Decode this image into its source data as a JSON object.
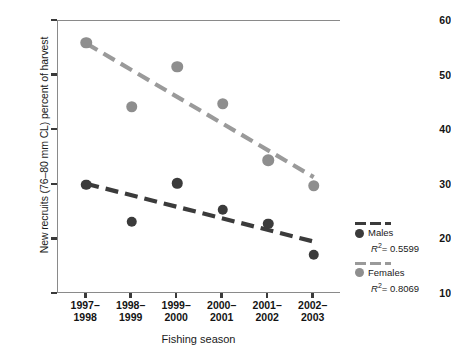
{
  "chart_data": {
    "type": "scatter",
    "title": "",
    "xlabel": "Fishing season",
    "ylabel": "New recruits (76–80 mm CL) percent of harvest",
    "categories": [
      "1997–1998",
      "1998–1999",
      "1999–2000",
      "2000–2001",
      "2001–2002",
      "2002–2003"
    ],
    "categories_lines": [
      [
        "1997–",
        "1998"
      ],
      [
        "1998–",
        "1999"
      ],
      [
        "1999–",
        "2000"
      ],
      [
        "2000–",
        "2001"
      ],
      [
        "2001–",
        "2002"
      ],
      [
        "2002–",
        "2003"
      ]
    ],
    "ylim": [
      10,
      60
    ],
    "yticks": [
      10,
      20,
      30,
      40,
      50,
      60
    ],
    "grid": false,
    "legend_position": "right-outside",
    "series": [
      {
        "name": "Males",
        "color": "#3b3b3b",
        "r_squared": "0.5599",
        "r_squared_label": "R²= 0.5599",
        "trendline": "dashed",
        "values": [
          30.0,
          23.2,
          30.3,
          25.4,
          22.9,
          17.2
        ],
        "trend_start": 30.2,
        "trend_end": 19.6
      },
      {
        "name": "Females",
        "color": "#8e8e8e",
        "r_squared": "0.8069",
        "r_squared_label": "R²= 0.8069",
        "trendline": "dashed",
        "values": [
          56.0,
          44.3,
          51.6,
          44.8,
          34.5,
          29.8
        ],
        "trend_start": 55.9,
        "trend_end": 31.4
      }
    ]
  },
  "legend": {
    "males_label": "Males",
    "females_label": "Females",
    "r2_symbol": "R",
    "r2_exponent": "2",
    "males_r2_value": "= 0.5599",
    "females_r2_value": "= 0.8069"
  },
  "caption": {
    "text": ""
  }
}
